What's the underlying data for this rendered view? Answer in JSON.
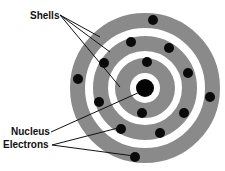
{
  "diagram": {
    "colors": {
      "shell": "#8a8a8a",
      "background": "#ffffff",
      "electron": "#0a0a0a",
      "nucleus": "#050505",
      "line": "#111111"
    },
    "center": {
      "x": 145,
      "y": 88
    },
    "nucleus": {
      "r": 9
    },
    "shells": [
      {
        "inner": 15,
        "outer": 30
      },
      {
        "inner": 37,
        "outer": 52
      },
      {
        "inner": 60,
        "outer": 75
      }
    ],
    "electrons": [
      {
        "x": 153,
        "y": 20
      },
      {
        "x": 131,
        "y": 42
      },
      {
        "x": 169,
        "y": 48
      },
      {
        "x": 104,
        "y": 63
      },
      {
        "x": 147,
        "y": 62
      },
      {
        "x": 188,
        "y": 73
      },
      {
        "x": 78,
        "y": 79
      },
      {
        "x": 210,
        "y": 97
      },
      {
        "x": 99,
        "y": 102
      },
      {
        "x": 142,
        "y": 113
      },
      {
        "x": 184,
        "y": 113
      },
      {
        "x": 121,
        "y": 129
      },
      {
        "x": 160,
        "y": 133
      },
      {
        "x": 135,
        "y": 157
      }
    ],
    "electron_r": 5,
    "labels": {
      "shells": "Shells",
      "nucleus": "Nucleus",
      "electrons": "Electrons"
    },
    "leader_lines": {
      "shells": [
        {
          "x1": 60,
          "y1": 15,
          "x2": 100,
          "y2": 37
        },
        {
          "x1": 60,
          "y1": 15,
          "x2": 110,
          "y2": 52
        },
        {
          "x1": 60,
          "y1": 15,
          "x2": 120,
          "y2": 87
        }
      ],
      "nucleus": [
        {
          "x1": 51,
          "y1": 132,
          "x2": 140,
          "y2": 92
        }
      ],
      "electrons": [
        {
          "x1": 52,
          "y1": 145,
          "x2": 118,
          "y2": 128
        },
        {
          "x1": 52,
          "y1": 145,
          "x2": 134,
          "y2": 156
        }
      ]
    }
  }
}
